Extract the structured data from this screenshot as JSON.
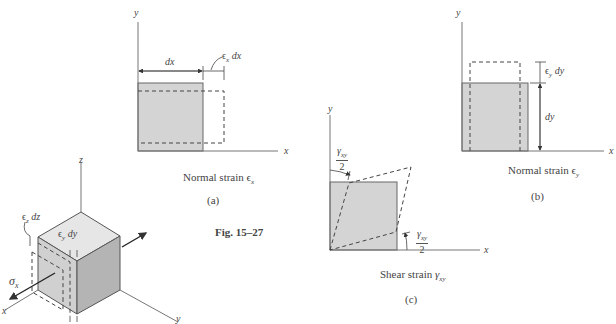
{
  "figure": {
    "number_label": "Fig. 15–27",
    "panels": {
      "a": {
        "caption": "Normal strain ϵx",
        "caption_text": "Normal strain ",
        "caption_symbol": "ϵ",
        "caption_sub": "x",
        "tag": "(a)",
        "axis_x": "x",
        "axis_y": "y",
        "dim_main": "dx",
        "dim_extra_symbol": "ϵ",
        "dim_extra_sub": "x",
        "dim_extra_tail": " dx"
      },
      "b": {
        "caption": "Normal strain ϵy",
        "caption_text": "Normal strain ",
        "caption_symbol": "ϵ",
        "caption_sub": "y",
        "tag": "(b)",
        "axis_x": "x",
        "axis_y": "y",
        "dim_main": "dy",
        "dim_extra_symbol": "ϵ",
        "dim_extra_sub": "y",
        "dim_extra_tail": " dy"
      },
      "c": {
        "caption": "Shear strain γxy",
        "caption_text": "Shear strain ",
        "caption_symbol": "γ",
        "caption_sub": "xy",
        "tag": "(c)",
        "axis_x": "x",
        "axis_y": "y",
        "angle_num_symbol": "γ",
        "angle_num_sub": "xy",
        "angle_den": "2"
      },
      "cube": {
        "axis_x": "x",
        "axis_y": "y",
        "axis_z": "z",
        "stress_symbol": "σ",
        "stress_sub": "x",
        "strain_z_symbol": "ϵ",
        "strain_z_sub": "z",
        "strain_z_tail": " dz",
        "strain_y_symbol": "ϵ",
        "strain_y_sub": "y",
        "strain_y_tail": " dy"
      }
    },
    "colors": {
      "fill": "#d4d4d4",
      "fill_dark": "#b8b8b8",
      "fill_top": "#e6e6e6",
      "line": "#555555",
      "dash": "#444444"
    }
  }
}
